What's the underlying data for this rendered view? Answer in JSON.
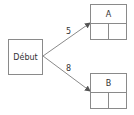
{
  "diagram": {
    "start_node": {
      "label": "Début"
    },
    "nodes": [
      {
        "id": "A",
        "label": "A"
      },
      {
        "id": "B",
        "label": "B"
      }
    ],
    "edges": [
      {
        "from": "Début",
        "to": "A",
        "label": "5"
      },
      {
        "from": "Début",
        "to": "B",
        "label": "8"
      }
    ],
    "colors": {
      "line": "#8a8a8a",
      "text": "#333333"
    }
  }
}
